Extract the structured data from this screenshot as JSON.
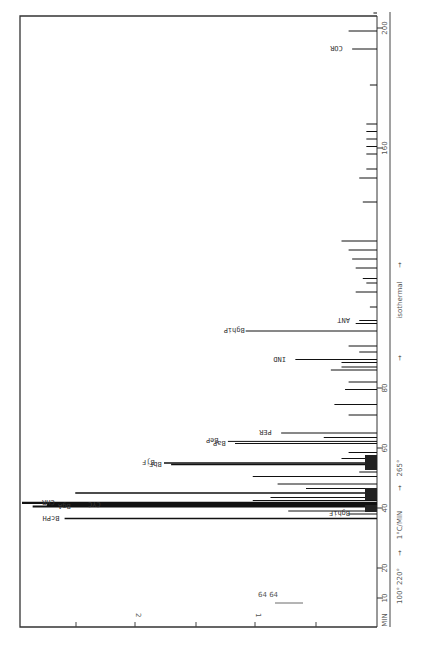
{
  "chart_data": {
    "type": "bar",
    "orientation": "rotated-chromatogram",
    "title": "",
    "xlabel": "MIN",
    "ylabel": "",
    "xlim": [
      0,
      205
    ],
    "x_ticks": [
      10,
      20,
      40,
      60,
      80,
      160,
      200
    ],
    "intensity_ticks": [
      "1",
      "2"
    ],
    "annotations": {
      "temperature_program": [
        "100° 220°",
        "1°C/MIN",
        "265°",
        "isothermal"
      ],
      "attenuation_arrows": [
        "64",
        "64"
      ],
      "time_axis_label": "MIN"
    },
    "peaks": [
      {
        "t": 36.5,
        "h": 0.88,
        "label": "BcPH"
      },
      {
        "t": 38.0,
        "h": 0.08,
        "label": "BghiF"
      },
      {
        "t": 39.0,
        "h": 0.25,
        "label": ""
      },
      {
        "t": 40.5,
        "h": 0.97,
        "label": "BgA"
      },
      {
        "t": 41.0,
        "h": 0.93,
        "label": "CYC"
      },
      {
        "t": 41.7,
        "h": 1.0,
        "label": "CHR"
      },
      {
        "t": 42.5,
        "h": 0.35,
        "label": ""
      },
      {
        "t": 43.5,
        "h": 0.3,
        "label": ""
      },
      {
        "t": 45.0,
        "h": 0.85,
        "label": ""
      },
      {
        "t": 46.5,
        "h": 0.2,
        "label": ""
      },
      {
        "t": 48.0,
        "h": 0.28,
        "label": ""
      },
      {
        "t": 50.5,
        "h": 0.35,
        "label": ""
      },
      {
        "t": 52.0,
        "h": 0.05,
        "label": ""
      },
      {
        "t": 54.5,
        "h": 0.58,
        "label": "BbF"
      },
      {
        "t": 55.0,
        "h": 0.6,
        "label": "BjF"
      },
      {
        "t": 56.5,
        "h": 0.1,
        "label": ""
      },
      {
        "t": 58.5,
        "h": 0.08,
        "label": ""
      },
      {
        "t": 61.5,
        "h": 0.4,
        "label": "BaP"
      },
      {
        "t": 62.2,
        "h": 0.42,
        "label": "BeP"
      },
      {
        "t": 63.5,
        "h": 0.15,
        "label": ""
      },
      {
        "t": 65.0,
        "h": 0.27,
        "label": "PER"
      },
      {
        "t": 71.0,
        "h": 0.08,
        "label": ""
      },
      {
        "t": 74.5,
        "h": 0.12,
        "label": ""
      },
      {
        "t": 79.5,
        "h": 0.09,
        "label": ""
      },
      {
        "t": 82.0,
        "h": 0.08,
        "label": ""
      },
      {
        "t": 86.0,
        "h": 0.13,
        "label": ""
      },
      {
        "t": 87.0,
        "h": 0.1,
        "label": ""
      },
      {
        "t": 88.5,
        "h": 0.1,
        "label": ""
      },
      {
        "t": 89.5,
        "h": 0.23,
        "label": "IND"
      },
      {
        "t": 92.0,
        "h": 0.05,
        "label": ""
      },
      {
        "t": 94.0,
        "h": 0.08,
        "label": ""
      },
      {
        "t": 99.0,
        "h": 0.37,
        "label": "BghiP"
      },
      {
        "t": 101.5,
        "h": 0.06,
        "label": ""
      },
      {
        "t": 102.5,
        "h": 0.05,
        "label": "ANT"
      },
      {
        "t": 107.0,
        "h": 0.02,
        "label": ""
      },
      {
        "t": 112.0,
        "h": 0.06,
        "label": ""
      },
      {
        "t": 115.0,
        "h": 0.03,
        "label": ""
      },
      {
        "t": 116.5,
        "h": 0.04,
        "label": ""
      },
      {
        "t": 120.0,
        "h": 0.06,
        "label": ""
      },
      {
        "t": 123.0,
        "h": 0.07,
        "label": ""
      },
      {
        "t": 126.0,
        "h": 0.08,
        "label": ""
      },
      {
        "t": 129.0,
        "h": 0.1,
        "label": ""
      },
      {
        "t": 142.0,
        "h": 0.04,
        "label": ""
      },
      {
        "t": 150.0,
        "h": 0.05,
        "label": ""
      },
      {
        "t": 153.0,
        "h": 0.03,
        "label": ""
      },
      {
        "t": 158.0,
        "h": 0.03,
        "label": ""
      },
      {
        "t": 160.5,
        "h": 0.03,
        "label": ""
      },
      {
        "t": 163.0,
        "h": 0.03,
        "label": ""
      },
      {
        "t": 165.5,
        "h": 0.03,
        "label": ""
      },
      {
        "t": 168.0,
        "h": 0.03,
        "label": ""
      },
      {
        "t": 181.0,
        "h": 0.02,
        "label": ""
      },
      {
        "t": 193.0,
        "h": 0.07,
        "label": "COR"
      },
      {
        "t": 199.0,
        "h": 0.08,
        "label": ""
      },
      {
        "t": 205.0,
        "h": 0.01,
        "label": ""
      }
    ]
  }
}
